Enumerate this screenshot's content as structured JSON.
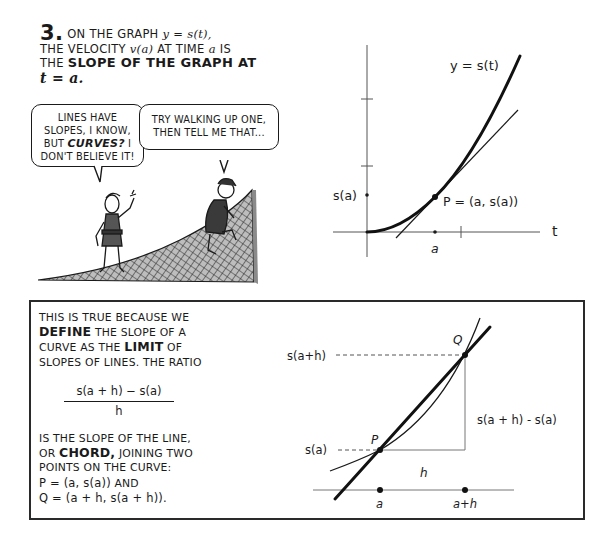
{
  "top_caption": {
    "number": "3.",
    "line1_prefix": "On the graph ",
    "line1_math": "y = s(t),",
    "line2_prefix": "the velocity ",
    "line2_math_v": "v(a)",
    "line2_mid": " at time ",
    "line2_math_a": "a",
    "line2_suffix": " is",
    "line3_prefix": "the ",
    "line3_bold": "slope of the graph at",
    "line4_bold": "t = a."
  },
  "speech_bubbles": [
    {
      "speaker": "small-character",
      "line1": "Lines have",
      "line2": "slopes, I know,",
      "line3_prefix": "but ",
      "line3_bold": "curves?",
      "line3_suffix": " I",
      "line4": "don't believe it!"
    },
    {
      "speaker": "climbing-character",
      "line1": "Try walking up one,",
      "line2": "then tell me that..."
    }
  ],
  "top_graph": {
    "curve_label": "y = s(t)",
    "y_tick_label": "s(a)",
    "point_label": "P = (a, s(a))",
    "x_tick_label": "a",
    "x_axis_label": "t"
  },
  "bottom_panel": {
    "text1_line1": "This is true because we",
    "text1_line2_bold": "define",
    "text1_line2_suffix": " the slope of a",
    "text1_line3_prefix": "curve as the ",
    "text1_line3_bold": "limit",
    "text1_line3_suffix": " of",
    "text1_line4": "slopes of lines. The ratio",
    "fraction_numerator": "s(a + h) − s(a)",
    "fraction_denominator": "h",
    "text2_line1": "is the slope of the line,",
    "text2_line2_prefix": "or ",
    "text2_line2_bold": "chord,",
    "text2_line2_suffix": " joining two",
    "text2_line3": "points on the curve:",
    "text2_line4_math": "P = (a, s(a))",
    "text2_line4_suffix": " and",
    "text2_line5_math": "Q = (a + h, s(a + h))."
  },
  "bottom_graph": {
    "y_label_top": "s(a+h)",
    "y_label_bottom": "s(a)",
    "point_q_label": "Q",
    "point_p_label": "P",
    "rise_label": "s(a + h) - s(a)",
    "run_label": "h",
    "x_label_a": "a",
    "x_label_ah": "a+h"
  }
}
